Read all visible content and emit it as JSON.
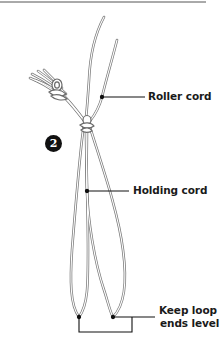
{
  "figure": {
    "step_number": "2",
    "labels": {
      "roller_cord": "Roller cord",
      "holding_cord": "Holding cord",
      "keep_loop_line1": "Keep loop",
      "keep_loop_line2": "ends level"
    },
    "colors": {
      "cord_outline": "#7a7a7a",
      "cord_fill": "#ffffff",
      "leader_line": "#111111",
      "badge_bg": "#111111",
      "badge_text": "#ffffff",
      "text": "#1a1a1a",
      "rule": "#555555"
    }
  }
}
